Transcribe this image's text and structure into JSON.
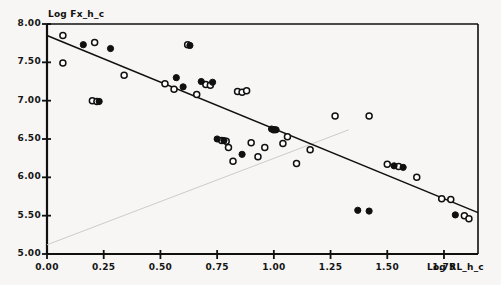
{
  "figure": {
    "background_color": "#f7f6f4",
    "ink_color": "#101010",
    "plot_area": {
      "left": 47,
      "top": 24,
      "right": 478,
      "bottom": 254
    }
  },
  "axis_titles": {
    "y": "Log Fx_h_c",
    "x": "Log RL_h_c"
  },
  "chart_data": {
    "type": "scatter",
    "title": "",
    "xlabel": "Log RL_h_c",
    "ylabel": "Log Fx_h_c",
    "xlim": [
      0.0,
      1.9
    ],
    "ylim": [
      5.0,
      8.0
    ],
    "xticks": [
      0.0,
      0.25,
      0.5,
      0.75,
      1.0,
      1.25,
      1.5,
      1.75
    ],
    "yticks": [
      5.0,
      5.5,
      6.0,
      6.5,
      7.0,
      7.5,
      8.0
    ],
    "xtick_labels": [
      "0.00",
      "0.25",
      "0.50",
      "0.75",
      "1.00",
      "1.25",
      "1.50",
      "1.75"
    ],
    "ytick_labels": [
      "5.00",
      "5.50",
      "6.00",
      "6.50",
      "7.00",
      "7.50",
      "8.00"
    ],
    "grid": false,
    "legend": "none",
    "series": [
      {
        "name": "open-circles",
        "marker": "open-circle",
        "points": [
          [
            0.07,
            7.85
          ],
          [
            0.07,
            7.49
          ],
          [
            0.21,
            7.76
          ],
          [
            0.2,
            7.0
          ],
          [
            0.22,
            6.99
          ],
          [
            0.34,
            7.33
          ],
          [
            0.52,
            7.22
          ],
          [
            0.56,
            7.15
          ],
          [
            0.62,
            7.73
          ],
          [
            0.66,
            7.08
          ],
          [
            0.7,
            7.21
          ],
          [
            0.72,
            7.2
          ],
          [
            0.77,
            6.48
          ],
          [
            0.79,
            6.47
          ],
          [
            0.8,
            6.39
          ],
          [
            0.82,
            6.21
          ],
          [
            0.84,
            7.12
          ],
          [
            0.86,
            7.11
          ],
          [
            0.88,
            7.13
          ],
          [
            0.9,
            6.45
          ],
          [
            0.93,
            6.27
          ],
          [
            0.96,
            6.39
          ],
          [
            1.0,
            6.62
          ],
          [
            1.04,
            6.44
          ],
          [
            1.06,
            6.53
          ],
          [
            1.1,
            6.18
          ],
          [
            1.16,
            6.36
          ],
          [
            1.27,
            6.8
          ],
          [
            1.42,
            6.8
          ],
          [
            1.5,
            6.17
          ],
          [
            1.55,
            6.14
          ],
          [
            1.63,
            6.0
          ],
          [
            1.74,
            5.72
          ],
          [
            1.78,
            5.71
          ],
          [
            1.84,
            5.5
          ],
          [
            1.86,
            5.46
          ]
        ]
      },
      {
        "name": "filled-circles",
        "marker": "filled-circle",
        "points": [
          [
            0.16,
            7.73
          ],
          [
            0.23,
            6.99
          ],
          [
            0.28,
            7.68
          ],
          [
            0.57,
            7.3
          ],
          [
            0.6,
            7.18
          ],
          [
            0.63,
            7.72
          ],
          [
            0.68,
            7.25
          ],
          [
            0.73,
            7.24
          ],
          [
            0.75,
            6.5
          ],
          [
            0.78,
            6.48
          ],
          [
            0.86,
            6.3
          ],
          [
            0.99,
            6.63
          ],
          [
            1.01,
            6.62
          ],
          [
            1.37,
            5.57
          ],
          [
            1.42,
            5.56
          ],
          [
            1.53,
            6.15
          ],
          [
            1.57,
            6.13
          ],
          [
            1.8,
            5.51
          ]
        ]
      }
    ],
    "fit_line": {
      "name": "regression-line",
      "x0": 0.0,
      "y0": 7.85,
      "x1": 1.9,
      "y1": 5.54
    },
    "artifact_line": {
      "name": "scan-crease-line",
      "x0": 0.0,
      "y0": 5.12,
      "x1": 1.33,
      "y1": 6.62
    }
  }
}
